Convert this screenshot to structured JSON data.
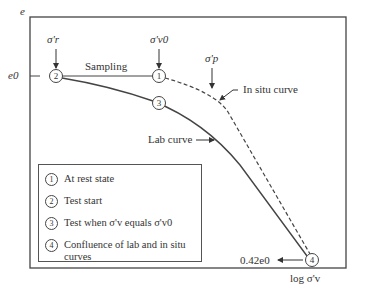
{
  "figure": {
    "axes": {
      "y_label": "e",
      "x_label": "log σ'v",
      "y_tick_e0": "e0",
      "y_tick_low": "0.42e0"
    },
    "annotations": {
      "sigma_r": "σ'r",
      "sigma_v0": "σ'v0",
      "sigma_p": "σ'p",
      "sampling": "Sampling",
      "in_situ_curve": "In situ curve",
      "lab_curve": "Lab curve"
    },
    "markers": [
      {
        "id": "1",
        "label": "1"
      },
      {
        "id": "2",
        "label": "2"
      },
      {
        "id": "3",
        "label": "3"
      },
      {
        "id": "4",
        "label": "4"
      }
    ],
    "legend": [
      {
        "num": "1",
        "text": "At rest state"
      },
      {
        "num": "2",
        "text": "Test start"
      },
      {
        "num": "3",
        "text": "Test when σ'v equals σ'v0"
      },
      {
        "num": "4",
        "text": "Confluence of lab and in situ curves"
      }
    ]
  }
}
